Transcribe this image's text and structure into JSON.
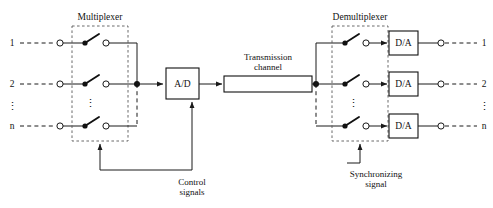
{
  "diagram": {
    "groups": {
      "multiplexer": {
        "label": "Multiplexer"
      },
      "demultiplexer": {
        "label": "Demultiplexer"
      }
    },
    "blocks": {
      "adc": {
        "label": "A/D"
      },
      "channel": {
        "label": "Transmission\nchannel",
        "line1": "Transmission",
        "line2": "channel"
      },
      "dac1": {
        "label": "D/A"
      },
      "dac2": {
        "label": "D/A"
      },
      "dac3": {
        "label": "D/A"
      }
    },
    "captions": {
      "control": {
        "line1": "Control",
        "line2": "signals"
      },
      "sync": {
        "line1": "Synchronizing",
        "line2": "signal"
      }
    },
    "inputs": [
      {
        "label": "1"
      },
      {
        "label": "2"
      },
      {
        "label": "n"
      }
    ],
    "input_ellipsis": "⋮",
    "outputs": [
      {
        "label": "1"
      },
      {
        "label": "2"
      },
      {
        "label": "n"
      }
    ],
    "output_ellipsis": "⋮",
    "mux_ellipsis": "⋮",
    "demux_ellipsis": "⋮",
    "colors": {
      "ink": "#111111",
      "wire": "#1a1a1a",
      "dashed_group": "#5a5a5a",
      "background": "#ffffff"
    }
  }
}
